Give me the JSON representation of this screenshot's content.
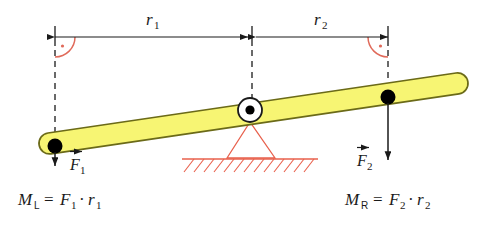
{
  "figure": {
    "background": "#ffffff"
  },
  "colors": {
    "bar_fill": "#f7f573",
    "bar_stroke": "#6b6a18",
    "support_red": "#e8604c",
    "arc_red": "#e06a5a",
    "ink": "#1a1a1a",
    "pivot_fill": "#ffffff",
    "pivot_dot": "#000000"
  },
  "dimensions": {
    "r1": {
      "label": "r",
      "subscript": "1",
      "name": "left-lever-arm"
    },
    "r2": {
      "label": "r",
      "subscript": "2",
      "name": "right-lever-arm"
    }
  },
  "forces": {
    "f1": {
      "label": "F",
      "subscript": "1",
      "direction": "down",
      "name": "left-force"
    },
    "f2": {
      "label": "F",
      "subscript": "2",
      "direction": "down",
      "name": "right-force"
    }
  },
  "equations": {
    "left": {
      "moment": "M",
      "moment_sub": "L",
      "equals": "=",
      "force": "F",
      "force_sub": "1",
      "dot": "·",
      "radius": "r",
      "radius_sub": "1"
    },
    "right": {
      "moment": "M",
      "moment_sub": "R",
      "equals": "=",
      "force": "F",
      "force_sub": "2",
      "dot": "·",
      "radius": "r",
      "radius_sub": "2"
    }
  },
  "annotations": {
    "right_angle_left": "90-degree angle marker left",
    "right_angle_right": "90-degree angle marker right",
    "pivot": "fulcrum pivot point",
    "ground": "hatched ground surface"
  }
}
